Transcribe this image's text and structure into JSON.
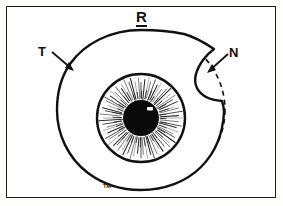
{
  "figure": {
    "title": "R",
    "title_meaning": "right-eye",
    "background_color": "#ffffff",
    "frame_color": "#1a1a1a",
    "ink_color": "#111111",
    "width": 283,
    "height": 206
  },
  "labels": {
    "temporal": "T",
    "nasal": "N",
    "bottom_mark": "TM"
  },
  "anatomy": {
    "globe_outline_name": "eye-globe-outline",
    "reference_circle_name": "reference-circle-dashed",
    "iris_name": "iris",
    "pupil_name": "pupil",
    "highlight_name": "corneal-light-reflex",
    "iris_stria_count": 72
  },
  "geometry": {
    "globe_center_x": 141,
    "globe_center_y": 110,
    "globe_radius_x": 84,
    "globe_radius_y": 80,
    "iris_center_x": 141,
    "iris_center_y": 118,
    "iris_radius": 44,
    "pupil_radius": 18,
    "highlight_x": 150,
    "highlight_y": 110
  },
  "annotations": {
    "temporal_arrow": {
      "from_x": 52,
      "from_y": 52,
      "to_x": 74,
      "to_y": 70
    },
    "nasal_arrow": {
      "from_x": 228,
      "from_y": 54,
      "to_x": 207,
      "to_y": 72
    }
  }
}
